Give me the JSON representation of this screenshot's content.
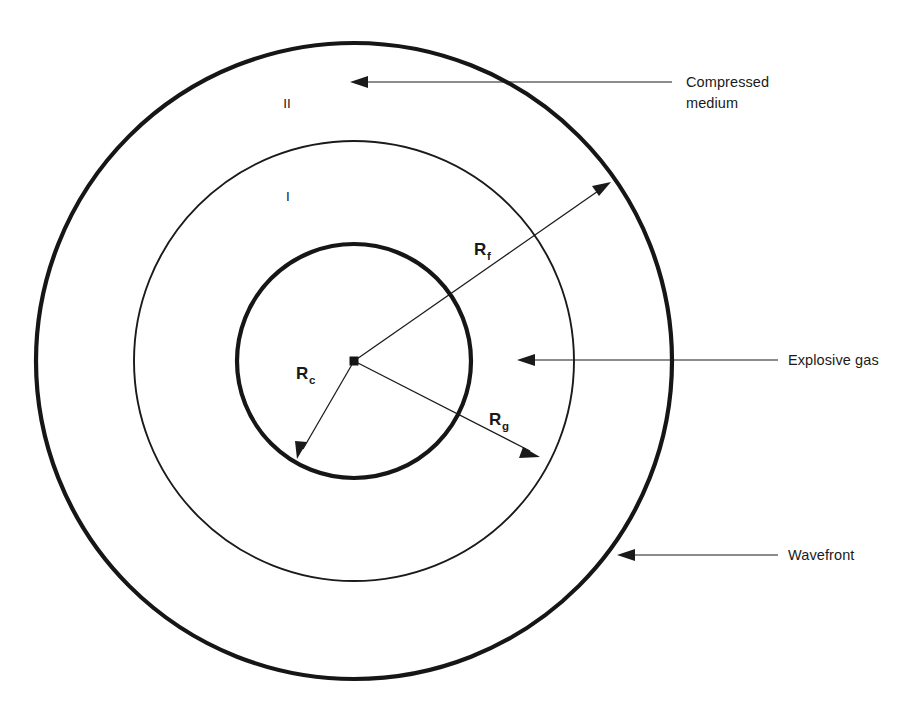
{
  "figure": {
    "background_color": "#ffffff",
    "ink_color": "#1a1a1a"
  },
  "geometry": {
    "center": {
      "x": 354,
      "y": 361
    },
    "circles": [
      {
        "name": "wavefront-circle",
        "radius": 318,
        "weight": "thick"
      },
      {
        "name": "contact-front-circle",
        "radius": 220,
        "weight": "thin"
      },
      {
        "name": "gas-sphere-circle",
        "radius": 117,
        "weight": "thick"
      }
    ]
  },
  "regions": {
    "outer_label": "II",
    "inner_label": "I"
  },
  "radii": {
    "core": {
      "symbol": "R",
      "subscript": "c"
    },
    "front": {
      "symbol": "R",
      "subscript": "f"
    },
    "gas": {
      "symbol": "R",
      "subscript": "g"
    }
  },
  "callouts": [
    {
      "id": "compressed-medium",
      "line1": "Compressed",
      "line2": "medium"
    },
    {
      "id": "explosive-gas",
      "line1": "Explosive gas",
      "line2": ""
    },
    {
      "id": "wavefront",
      "line1": "Wavefront",
      "line2": ""
    }
  ]
}
